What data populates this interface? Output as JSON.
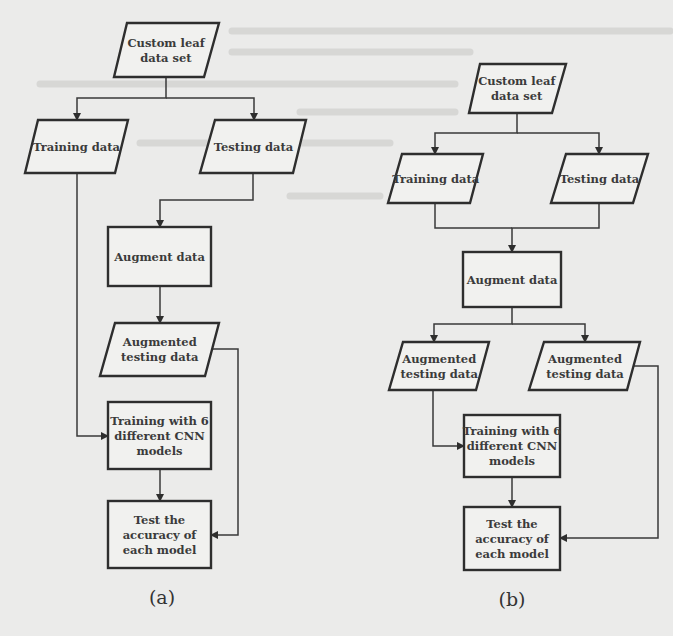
{
  "figure": {
    "background_color": "#ebebea",
    "stroke_color": "#2e2e2e",
    "text_color": "#3b3b3b"
  },
  "diagrams": [
    {
      "id": "a",
      "caption": "(a)",
      "caption_pos": [
        162,
        604
      ],
      "nodes": [
        {
          "id": "dataset",
          "shape": "parallelogram",
          "lines": [
            "Custom leaf",
            "data set"
          ],
          "top": [
            127,
            219
          ],
          "bottom": [
            114,
            204
          ],
          "y": [
            23,
            77
          ]
        },
        {
          "id": "training",
          "shape": "parallelogram",
          "lines": [
            "Training data"
          ],
          "top": [
            38,
            128
          ],
          "bottom": [
            25,
            115
          ],
          "y": [
            120,
            173
          ]
        },
        {
          "id": "testing",
          "shape": "parallelogram",
          "lines": [
            "Testing data"
          ],
          "top": [
            215,
            306
          ],
          "bottom": [
            200,
            293
          ],
          "y": [
            120,
            173
          ]
        },
        {
          "id": "augment",
          "shape": "rect",
          "lines": [
            "Augment data"
          ],
          "x": [
            108,
            211
          ],
          "y": [
            227,
            286
          ]
        },
        {
          "id": "aug-testing",
          "shape": "parallelogram",
          "lines": [
            "Augmented",
            "testing data"
          ],
          "top": [
            115,
            219
          ],
          "bottom": [
            100,
            205
          ],
          "y": [
            323,
            376
          ]
        },
        {
          "id": "train-cnn",
          "shape": "rect",
          "lines": [
            "Training with 6",
            "different CNN",
            "models"
          ],
          "x": [
            108,
            211
          ],
          "y": [
            402,
            469
          ]
        },
        {
          "id": "test-accuracy",
          "shape": "rect",
          "lines": [
            "Test the",
            "accuracy of",
            "each model"
          ],
          "x": [
            108,
            211
          ],
          "y": [
            501,
            568
          ]
        }
      ],
      "edges": [
        {
          "from": "dataset",
          "to": "training",
          "points": [
            [
              166,
              77
            ],
            [
              166,
              98
            ],
            [
              77,
              98
            ],
            [
              77,
              120
            ]
          ],
          "arrow": true
        },
        {
          "from": "dataset",
          "to": "testing",
          "points": [
            [
              166,
              98
            ],
            [
              254,
              98
            ],
            [
              254,
              120
            ]
          ],
          "arrow": true
        },
        {
          "from": "testing",
          "to": "augment",
          "points": [
            [
              253,
              173
            ],
            [
              253,
              200
            ],
            [
              160,
              200
            ],
            [
              160,
              227
            ]
          ],
          "arrow": true
        },
        {
          "from": "augment",
          "to": "aug-testing",
          "points": [
            [
              160,
              286
            ],
            [
              160,
              323
            ]
          ],
          "arrow": true
        },
        {
          "from": "training",
          "to": "train-cnn",
          "points": [
            [
              77,
              173
            ],
            [
              77,
              436
            ],
            [
              108,
              436
            ]
          ],
          "arrow": true
        },
        {
          "from": "train-cnn",
          "to": "test-accuracy",
          "points": [
            [
              160,
              469
            ],
            [
              160,
              501
            ]
          ],
          "arrow": true
        },
        {
          "from": "aug-testing",
          "to": "test-accuracy",
          "points": [
            [
              213,
              349
            ],
            [
              238,
              349
            ],
            [
              238,
              535
            ],
            [
              211,
              535
            ]
          ],
          "arrow": true
        }
      ]
    },
    {
      "id": "b",
      "caption": "(b)",
      "caption_pos": [
        512,
        606
      ],
      "nodes": [
        {
          "id": "dataset",
          "shape": "parallelogram",
          "lines": [
            "Custom leaf",
            "data set"
          ],
          "top": [
            480,
            566
          ],
          "bottom": [
            469,
            552
          ],
          "y": [
            64,
            113
          ]
        },
        {
          "id": "training",
          "shape": "parallelogram",
          "lines": [
            "Training data"
          ],
          "top": [
            402,
            483
          ],
          "bottom": [
            388,
            470
          ],
          "y": [
            154,
            203
          ]
        },
        {
          "id": "testing",
          "shape": "parallelogram",
          "lines": [
            "Testing data"
          ],
          "top": [
            566,
            648
          ],
          "bottom": [
            551,
            633
          ],
          "y": [
            154,
            203
          ]
        },
        {
          "id": "augment",
          "shape": "rect",
          "lines": [
            "Augment data"
          ],
          "x": [
            463,
            561
          ],
          "y": [
            252,
            307
          ]
        },
        {
          "id": "aug-testing-left",
          "shape": "parallelogram",
          "lines": [
            "Augmented",
            "testing data"
          ],
          "top": [
            403,
            489
          ],
          "bottom": [
            389,
            476
          ],
          "y": [
            342,
            390
          ]
        },
        {
          "id": "aug-testing-right",
          "shape": "parallelogram",
          "lines": [
            "Augmented",
            "testing data"
          ],
          "top": [
            544,
            640
          ],
          "bottom": [
            529,
            627
          ],
          "y": [
            342,
            390
          ]
        },
        {
          "id": "train-cnn",
          "shape": "rect",
          "lines": [
            "Training with 6",
            "different CNN",
            "models"
          ],
          "x": [
            464,
            560
          ],
          "y": [
            415,
            477
          ]
        },
        {
          "id": "test-accuracy",
          "shape": "rect",
          "lines": [
            "Test the",
            "accuracy of",
            "each model"
          ],
          "x": [
            464,
            560
          ],
          "y": [
            507,
            570
          ]
        }
      ],
      "edges": [
        {
          "from": "dataset",
          "to": "training",
          "points": [
            [
              517,
              113
            ],
            [
              517,
              133
            ],
            [
              435,
              133
            ],
            [
              435,
              154
            ]
          ],
          "arrow": true
        },
        {
          "from": "dataset",
          "to": "testing",
          "points": [
            [
              517,
              133
            ],
            [
              599,
              133
            ],
            [
              599,
              154
            ]
          ],
          "arrow": true
        },
        {
          "from": "training",
          "to": "augment",
          "points": [
            [
              435,
              203
            ],
            [
              435,
              228
            ],
            [
              512,
              228
            ]
          ],
          "arrow": false
        },
        {
          "from": "testing",
          "to": "augment",
          "points": [
            [
              599,
              203
            ],
            [
              599,
              228
            ],
            [
              512,
              228
            ],
            [
              512,
              252
            ]
          ],
          "arrow": true
        },
        {
          "from": "augment",
          "to": "aug-testing-left",
          "points": [
            [
              512,
              307
            ],
            [
              512,
              324
            ],
            [
              434,
              324
            ],
            [
              434,
              342
            ]
          ],
          "arrow": true
        },
        {
          "from": "augment",
          "to": "aug-testing-right",
          "points": [
            [
              512,
              324
            ],
            [
              585,
              324
            ],
            [
              585,
              342
            ]
          ],
          "arrow": true
        },
        {
          "from": "aug-testing-left",
          "to": "train-cnn",
          "points": [
            [
              433,
              390
            ],
            [
              433,
              446
            ],
            [
              464,
              446
            ]
          ],
          "arrow": true
        },
        {
          "from": "train-cnn",
          "to": "test-accuracy",
          "points": [
            [
              512,
              477
            ],
            [
              512,
              507
            ]
          ],
          "arrow": true
        },
        {
          "from": "aug-testing-right",
          "to": "test-accuracy",
          "points": [
            [
              634,
              366
            ],
            [
              658,
              366
            ],
            [
              658,
              538
            ],
            [
              560,
              538
            ]
          ],
          "arrow": true
        }
      ]
    }
  ]
}
